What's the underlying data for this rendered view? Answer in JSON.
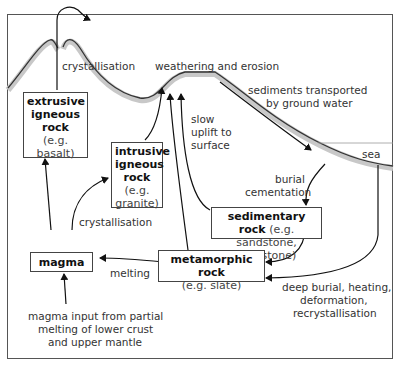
{
  "diagram": {
    "boxes": {
      "extrusive": {
        "name": "extrusive igneous rock",
        "l1": "extrusive",
        "l2": "igneous",
        "l3": "rock",
        "example": "(e.g. basalt)"
      },
      "intrusive": {
        "l1": "intrusive",
        "l2": "igneous",
        "l3": "rock",
        "ex_a": "(e.g.",
        "ex_b": "granite)"
      },
      "sedimentary": {
        "name": "sedimentary rock",
        "example_a": "(e.g.",
        "example_b": "sandstone, mudstone)"
      },
      "metamorphic": {
        "name": "metamorphic rock",
        "example": "(e.g. slate)"
      },
      "magma": {
        "name": "magma"
      }
    },
    "labels": {
      "crystallisation_top": "crystallisation",
      "weathering": "weathering and erosion",
      "sediments_1": "sediments transported",
      "sediments_2": "by ground water",
      "sea": "sea",
      "uplift_1": "slow",
      "uplift_2": "uplift to",
      "uplift_3": "surface",
      "burial_1": "burial",
      "burial_2": "cementation",
      "crystallisation_mid": "crystallisation",
      "melting": "melting",
      "deep_1": "deep burial, heating,",
      "deep_2": "deformation,",
      "deep_3": "recrystallisation",
      "input_1": "magma input from partial",
      "input_2": "melting of lower crust",
      "input_3": "and upper mantle"
    },
    "colors": {
      "line": "#222222",
      "shadow": "#bdbdbd",
      "box_border": "#444444"
    }
  }
}
